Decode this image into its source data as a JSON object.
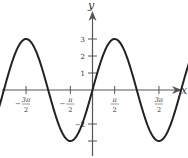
{
  "chart_data": {
    "type": "line",
    "title": "",
    "function": "y = 3 sin x",
    "xlabel": "x",
    "ylabel": "y",
    "xlim": [
      -3.9,
      3.9
    ],
    "ylim": [
      -3.3,
      3.5
    ],
    "x_unit": "pi",
    "grid": false,
    "legend": null,
    "x_ticks": [
      {
        "value": -3.5,
        "num": "7π",
        "den": "2",
        "sign": "−"
      },
      {
        "value": -2.5,
        "num": "5π",
        "den": "2",
        "sign": "−"
      },
      {
        "value": -1.5,
        "num": "3π",
        "den": "2",
        "sign": "−"
      },
      {
        "value": -0.5,
        "num": "π",
        "den": "2",
        "sign": "−"
      },
      {
        "value": 0.5,
        "num": "π",
        "den": "2",
        "sign": ""
      },
      {
        "value": 1.5,
        "num": "3π",
        "den": "2",
        "sign": ""
      },
      {
        "value": 2.5,
        "num": "5π",
        "den": "2",
        "sign": ""
      }
    ],
    "y_ticks": [
      {
        "value": 3,
        "label": "3"
      },
      {
        "value": 2,
        "label": "2"
      },
      {
        "value": 1,
        "label": "1"
      },
      {
        "value": -2,
        "label": "−2"
      },
      {
        "value": -3,
        "label": ""
      }
    ],
    "series": [
      {
        "name": "3 sin x",
        "amplitude": 3,
        "period_pi": 2,
        "phase": 0,
        "x_range_pi": [
          -3.9,
          3.5
        ],
        "color": "#222222"
      }
    ]
  }
}
